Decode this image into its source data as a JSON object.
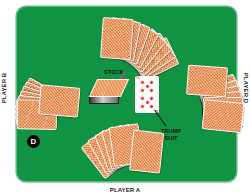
{
  "diagram": {
    "type": "card-table-layout",
    "table_color": "#109443",
    "card_back_color": "#e8945c",
    "players": {
      "bottom": "PLAYER A",
      "left": "PLAYER B",
      "right": "PLAYER D"
    },
    "center": {
      "stock_label": "STOCK",
      "trump_label_line1": "TRUMP",
      "trump_label_line2": "SUIT",
      "trump_card": {
        "rank": "10",
        "suit": "diamonds",
        "suit_color": "#ee3a2a"
      }
    },
    "dealer_marker": "D",
    "hands": [
      {
        "position": "top",
        "cards": 8
      },
      {
        "position": "left",
        "cards": 8
      },
      {
        "position": "right",
        "cards": 8
      },
      {
        "position": "bottom",
        "cards": 8
      }
    ]
  }
}
